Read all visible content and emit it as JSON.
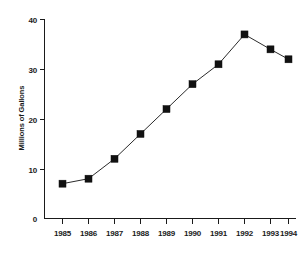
{
  "chart_data": {
    "type": "line",
    "title": "",
    "subtitle": "",
    "xlabel": "",
    "ylabel": "Millions of Gallons",
    "categories": [
      "1985",
      "1986",
      "1987",
      "1988",
      "1989",
      "1990",
      "1991",
      "1992",
      "1993",
      "1994"
    ],
    "x": [
      1985,
      1986,
      1987,
      1988,
      1989,
      1990,
      1991,
      1992,
      1993,
      1994
    ],
    "values": [
      7,
      8,
      12,
      17,
      22,
      27,
      31,
      37,
      34,
      32
    ],
    "series": [
      {
        "name": "Millions of Gallons",
        "values": [
          7,
          8,
          12,
          17,
          22,
          27,
          31,
          37,
          34,
          32
        ]
      }
    ],
    "ylim": [
      0,
      40
    ],
    "yticks": [
      0,
      10,
      20,
      30,
      40
    ],
    "ytick_labels": [
      "0",
      "10",
      "20",
      "30",
      "40"
    ],
    "xtick_labels": [
      "1985",
      "1986",
      "1987",
      "1988",
      "1989",
      "1990",
      "1991",
      "1992",
      "1993",
      "1994"
    ],
    "grid": false,
    "legend": false,
    "legend_position": "none",
    "marker": "square",
    "line_color": "#2b2b2b",
    "marker_color": "#111111",
    "background_color": "#ffffff"
  },
  "axes": {
    "y_title": "Millions of Gallons",
    "y_tick_0": "0",
    "y_tick_1": "10",
    "y_tick_2": "20",
    "y_tick_3": "30",
    "y_tick_4": "40",
    "x_tick_0": "1985",
    "x_tick_1": "1986",
    "x_tick_2": "1987",
    "x_tick_3": "1988",
    "x_tick_4": "1989",
    "x_tick_5": "1990",
    "x_tick_6": "1991",
    "x_tick_7": "1992",
    "x_tick_8": "1993",
    "x_tick_9": "1994"
  }
}
